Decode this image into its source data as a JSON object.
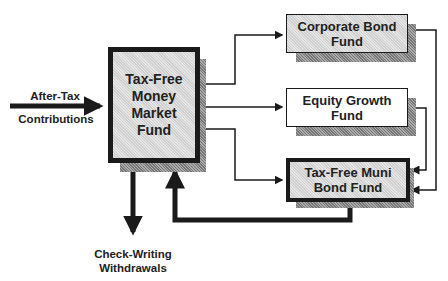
{
  "nodes": {
    "main": "Tax-Free\nMoney\nMarket\nFund",
    "corporate": "Corporate Bond\nFund",
    "equity": "Equity Growth\nFund",
    "muni": "Tax-Free Muni\nBond Fund"
  },
  "labels": {
    "input_top": "After-Tax",
    "input_bottom": "Contributions",
    "output": "Check-Writing\nWithdrawals"
  },
  "colors": {
    "line": "#1a1a1a",
    "fill": "#d8d8d8",
    "shadow": "#8a8a8a"
  }
}
